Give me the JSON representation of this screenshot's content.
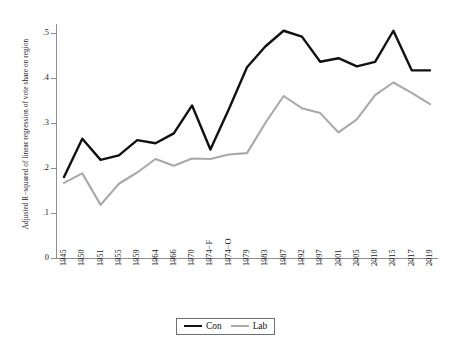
{
  "axis": {
    "ylabel": "Adjusted R−squared of linear regression of vote share on region",
    "yticks": [
      "0",
      ".1",
      ".2",
      ".3",
      ".4",
      ".5"
    ]
  },
  "legend": {
    "items": [
      {
        "label": "Con",
        "color": "#111111"
      },
      {
        "label": "Lab",
        "color": "#a9a9a9"
      }
    ]
  },
  "chart_data": {
    "type": "line",
    "title": "",
    "xlabel": "",
    "ylabel": "Adjusted R−squared of linear regression of vote share on region",
    "ylim": [
      0,
      0.52
    ],
    "yticks": [
      0,
      0.1,
      0.2,
      0.3,
      0.4,
      0.5
    ],
    "grid": false,
    "legend_position": "bottom",
    "categories": [
      "1945",
      "1950",
      "1951",
      "1955",
      "1959",
      "1964",
      "1966",
      "1970",
      "1974−F",
      "1974−O",
      "1979",
      "1983",
      "1987",
      "1992",
      "1997",
      "2001",
      "2005",
      "2010",
      "2015",
      "2017",
      "2019"
    ],
    "series": [
      {
        "name": "Con",
        "color": "#111111",
        "values": [
          0.18,
          0.265,
          0.218,
          0.228,
          0.262,
          0.255,
          0.277,
          0.339,
          0.241,
          0.33,
          0.424,
          0.47,
          0.505,
          0.492,
          0.436,
          0.444,
          0.426,
          0.436,
          0.505,
          0.417,
          0.417
        ]
      },
      {
        "name": "Lab",
        "color": "#a9a9a9",
        "values": [
          0.167,
          0.188,
          0.118,
          0.165,
          0.19,
          0.22,
          0.205,
          0.221,
          0.22,
          0.23,
          0.233,
          0.3,
          0.36,
          0.333,
          0.322,
          0.279,
          0.308,
          0.362,
          0.39,
          0.367,
          0.342
        ]
      }
    ]
  }
}
